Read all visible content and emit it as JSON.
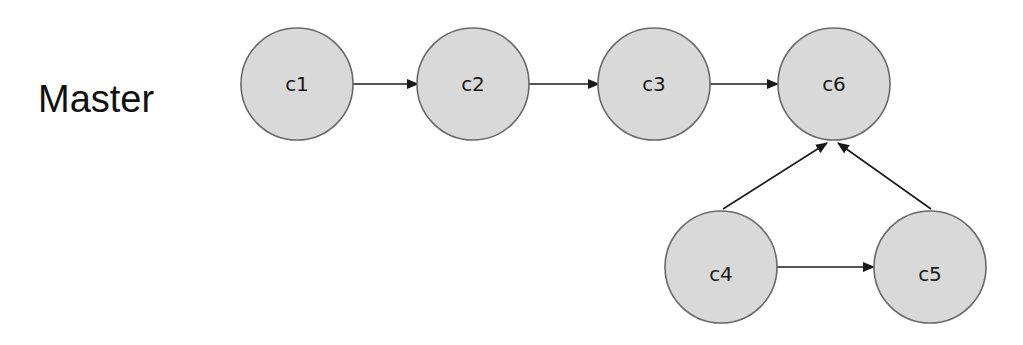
{
  "branch_label": "Master",
  "colors": {
    "node_fill": "#d9d9d9",
    "node_stroke": "#6a6a6a",
    "edge": "#1a1a1a",
    "text": "#1a1a1a"
  },
  "nodes": [
    {
      "id": "c1",
      "label": "c1",
      "cx": 297,
      "cy": 84
    },
    {
      "id": "c2",
      "label": "c2",
      "cx": 473,
      "cy": 84
    },
    {
      "id": "c3",
      "label": "c3",
      "cx": 654,
      "cy": 84
    },
    {
      "id": "c6",
      "label": "c6",
      "cx": 834,
      "cy": 84
    },
    {
      "id": "c4",
      "label": "c4",
      "cx": 721,
      "cy": 274
    },
    {
      "id": "c5",
      "label": "c5",
      "cx": 930,
      "cy": 274
    }
  ],
  "edges": [
    {
      "from": "c1",
      "to": "c2"
    },
    {
      "from": "c2",
      "to": "c3"
    },
    {
      "from": "c3",
      "to": "c6"
    },
    {
      "from": "c4",
      "to": "c6"
    },
    {
      "from": "c5",
      "to": "c6"
    },
    {
      "from": "c4",
      "to": "c5"
    }
  ]
}
